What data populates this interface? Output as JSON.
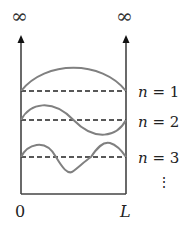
{
  "diagram": {
    "walls": {
      "left_label": "∞",
      "right_label": "∞"
    },
    "x_axis": {
      "left_label": "0",
      "right_label": "L"
    },
    "modes": [
      {
        "n": 1,
        "label_var": "n",
        "label_eq": "=",
        "label_val": "1"
      },
      {
        "n": 2,
        "label_var": "n",
        "label_eq": "=",
        "label_val": "2"
      },
      {
        "n": 3,
        "label_var": "n",
        "label_eq": "=",
        "label_val": "3"
      }
    ],
    "continuation": "⋮",
    "colors": {
      "wall": "#444444",
      "wave": "#808080",
      "dashed": "#222222",
      "text": "#222222"
    }
  }
}
